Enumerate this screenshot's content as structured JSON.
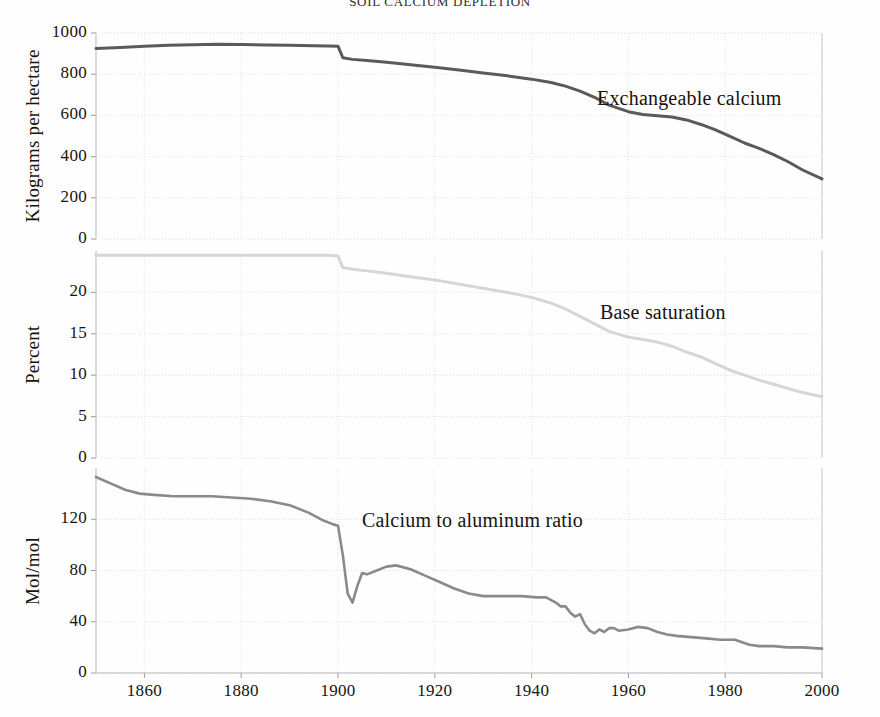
{
  "chart_data": {
    "type": "line",
    "title": "SOIL CALCIUM DEPLETION",
    "xlabel": "",
    "xlim": [
      1850,
      2000
    ],
    "xticks": [
      1860,
      1880,
      1900,
      1920,
      1940,
      1960,
      1980,
      2000
    ],
    "grid": true,
    "legend_position": "inline-right",
    "panels": [
      {
        "id": "exchangeable-calcium",
        "ylabel": "Kilograms per hectare",
        "series_label": "Exchangeable calcium",
        "color": "#5a5a5a",
        "ylim": [
          0,
          1000
        ],
        "yticks": [
          0,
          200,
          400,
          600,
          800,
          1000
        ],
        "x": [
          1850,
          1855,
          1860,
          1865,
          1870,
          1875,
          1880,
          1885,
          1890,
          1895,
          1898,
          1900,
          1901,
          1903,
          1906,
          1910,
          1915,
          1920,
          1925,
          1930,
          1935,
          1940,
          1944,
          1947,
          1950,
          1953,
          1956,
          1960,
          1963,
          1966,
          1969,
          1972,
          1975,
          1978,
          1981,
          1984,
          1987,
          1990,
          1993,
          1996,
          2000
        ],
        "y": [
          925,
          930,
          936,
          940,
          943,
          945,
          944,
          942,
          940,
          938,
          937,
          936,
          880,
          872,
          866,
          858,
          846,
          834,
          820,
          806,
          792,
          776,
          760,
          742,
          718,
          688,
          650,
          618,
          604,
          598,
          592,
          578,
          556,
          530,
          498,
          466,
          440,
          410,
          375,
          335,
          292
        ]
      },
      {
        "id": "base-saturation",
        "ylabel": "Percent",
        "series_label": "Base saturation",
        "color": "#d6d6d6",
        "ylim": [
          0,
          25
        ],
        "yticks": [
          0,
          5,
          10,
          15,
          20
        ],
        "x": [
          1850,
          1860,
          1870,
          1880,
          1890,
          1898,
          1900,
          1901,
          1903,
          1906,
          1910,
          1915,
          1920,
          1925,
          1930,
          1935,
          1940,
          1944,
          1947,
          1950,
          1953,
          1956,
          1960,
          1963,
          1966,
          1969,
          1972,
          1975,
          1978,
          1981,
          1984,
          1987,
          1990,
          1993,
          1996,
          2000
        ],
        "y": [
          24.5,
          24.5,
          24.5,
          24.5,
          24.5,
          24.5,
          24.4,
          23.0,
          22.8,
          22.6,
          22.3,
          21.9,
          21.5,
          21.0,
          20.5,
          20.0,
          19.4,
          18.7,
          18.0,
          17.1,
          16.2,
          15.3,
          14.6,
          14.3,
          14.0,
          13.5,
          12.8,
          12.2,
          11.4,
          10.6,
          10.0,
          9.4,
          8.9,
          8.4,
          7.9,
          7.4
        ]
      },
      {
        "id": "calcium-to-aluminum-ratio",
        "ylabel": "Mol/mol",
        "series_label": "Calcium to aluminum ratio",
        "color": "#8a8a8a",
        "ylim": [
          0,
          160
        ],
        "yticks": [
          0,
          40,
          80,
          120
        ],
        "x": [
          1850,
          1853,
          1856,
          1859,
          1862,
          1866,
          1870,
          1874,
          1878,
          1882,
          1886,
          1890,
          1894,
          1897,
          1899,
          1900,
          1901,
          1902,
          1903,
          1904,
          1905,
          1906,
          1908,
          1910,
          1912,
          1915,
          1918,
          1921,
          1924,
          1927,
          1930,
          1934,
          1938,
          1941,
          1943,
          1945,
          1946,
          1947,
          1948,
          1949,
          1950,
          1951,
          1952,
          1953,
          1954,
          1955,
          1956,
          1957,
          1958,
          1960,
          1962,
          1964,
          1966,
          1968,
          1970,
          1973,
          1976,
          1979,
          1982,
          1985,
          1987,
          1990,
          1993,
          1996,
          2000
        ],
        "y": [
          153,
          148,
          143,
          140,
          139,
          138,
          138,
          138,
          137,
          136,
          134,
          131,
          125,
          119,
          116,
          115,
          92,
          62,
          55,
          68,
          78,
          77,
          80,
          83,
          84,
          81,
          76,
          71,
          66,
          62,
          60,
          60,
          60,
          59,
          59,
          55,
          52,
          52,
          47,
          44,
          46,
          38,
          33,
          31,
          34,
          32,
          35,
          35,
          33,
          34,
          36,
          35,
          32,
          30,
          29,
          28,
          27,
          26,
          26,
          22,
          21,
          21,
          20,
          20,
          19
        ]
      }
    ]
  }
}
